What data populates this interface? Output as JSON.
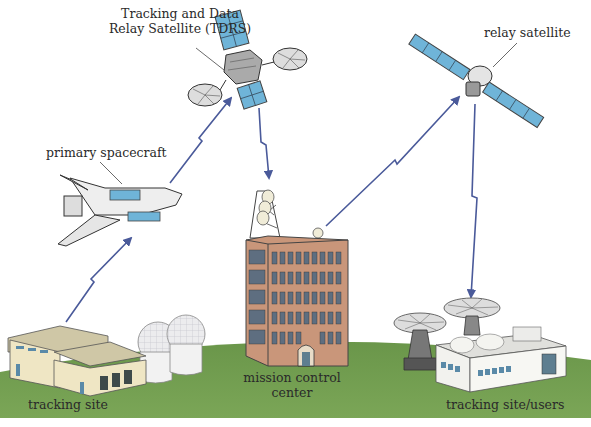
{
  "diagram": {
    "type": "satellite-communication-network",
    "colors": {
      "ground": "#6f9a4e",
      "ground_light": "#82ad5c",
      "arrow": "#4a5a9a",
      "solar_panel": "#6fb4d8",
      "building_brick": "#c9967a",
      "hangar": "#efe6c4",
      "dome": "#e8e8ea"
    },
    "nodes": [
      {
        "id": "tdrs",
        "label": "Tracking and Data\nRelay Satellite (TDRS)",
        "label_line1": "Tracking and Data",
        "label_line2": "Relay Satellite (TDRS)",
        "icon": "satellite-icon"
      },
      {
        "id": "relay",
        "label": "relay satellite",
        "icon": "satellite-icon"
      },
      {
        "id": "shuttle",
        "label": "primary spacecraft",
        "icon": "space-shuttle-icon"
      },
      {
        "id": "mission",
        "label": "mission control\ncenter",
        "label_line1": "mission control",
        "label_line2": "center",
        "icon": "office-building-icon"
      },
      {
        "id": "site",
        "label": "tracking site",
        "icon": "hangar-radome-icon"
      },
      {
        "id": "users",
        "label": "tracking site/users",
        "icon": "dish-antenna-building-icon"
      }
    ],
    "links": [
      {
        "from": "site",
        "to": "shuttle",
        "style": "lightning-arrow"
      },
      {
        "from": "shuttle",
        "to": "tdrs",
        "style": "lightning-arrow"
      },
      {
        "from": "tdrs",
        "to": "mission",
        "style": "lightning-arrow"
      },
      {
        "from": "mission",
        "to": "relay",
        "style": "lightning-arrow"
      },
      {
        "from": "relay",
        "to": "users",
        "style": "lightning-arrow"
      }
    ]
  }
}
